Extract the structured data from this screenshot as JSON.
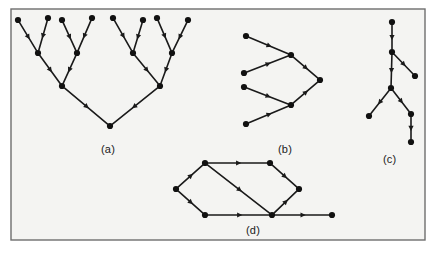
{
  "figure": {
    "background_color": "#f4f4f2",
    "page_color": "#ffffff",
    "border_color": "#6e6e6e",
    "node_color": "#111111",
    "edge_color": "#1a1a1a",
    "frame": {
      "x": 11,
      "y": 9,
      "width": 414,
      "height": 231
    },
    "node_radius": 3.1,
    "edge_width": 1.6
  },
  "panels": [
    {
      "id": "panel-a",
      "caption": "(a)",
      "caption_x": 110,
      "caption_y": 150,
      "description": "complete binary tree, eight leaves, edges directed from leaves toward root"
    },
    {
      "id": "panel-b",
      "caption": "(b)",
      "caption_x": 287,
      "caption_y": 150,
      "description": "two-level merge tree, four sources merging into one sink"
    },
    {
      "id": "panel-c",
      "caption": "(c)",
      "caption_x": 392,
      "caption_y": 160,
      "description": "vertical chain with two branchings"
    },
    {
      "id": "panel-d",
      "caption": "(d)",
      "caption_x": 255,
      "caption_y": 231,
      "description": "directed acyclic graph with a diamond and a trailing edge"
    }
  ],
  "graphs": {
    "a": {
      "nodes": [
        {
          "id": "a-l1",
          "x": 18,
          "y": 20
        },
        {
          "id": "a-l2",
          "x": 48,
          "y": 18
        },
        {
          "id": "a-l3",
          "x": 62,
          "y": 20
        },
        {
          "id": "a-l4",
          "x": 92,
          "y": 18
        },
        {
          "id": "a-l5",
          "x": 113,
          "y": 18
        },
        {
          "id": "a-l6",
          "x": 143,
          "y": 20
        },
        {
          "id": "a-l7",
          "x": 157,
          "y": 18
        },
        {
          "id": "a-l8",
          "x": 188,
          "y": 20
        },
        {
          "id": "a-m1",
          "x": 38,
          "y": 53
        },
        {
          "id": "a-m2",
          "x": 77,
          "y": 53
        },
        {
          "id": "a-m3",
          "x": 133,
          "y": 53
        },
        {
          "id": "a-m4",
          "x": 172,
          "y": 53
        },
        {
          "id": "a-n1",
          "x": 62,
          "y": 86
        },
        {
          "id": "a-n2",
          "x": 160,
          "y": 86
        },
        {
          "id": "a-root",
          "x": 110,
          "y": 126
        }
      ],
      "edges": [
        {
          "from": "a-l1",
          "to": "a-m1"
        },
        {
          "from": "a-l2",
          "to": "a-m1"
        },
        {
          "from": "a-l3",
          "to": "a-m2"
        },
        {
          "from": "a-l4",
          "to": "a-m2"
        },
        {
          "from": "a-l5",
          "to": "a-m3"
        },
        {
          "from": "a-l6",
          "to": "a-m3"
        },
        {
          "from": "a-l7",
          "to": "a-m4"
        },
        {
          "from": "a-l8",
          "to": "a-m4"
        },
        {
          "from": "a-m1",
          "to": "a-n1"
        },
        {
          "from": "a-m2",
          "to": "a-n1"
        },
        {
          "from": "a-m3",
          "to": "a-n2"
        },
        {
          "from": "a-m4",
          "to": "a-n2"
        },
        {
          "from": "a-n1",
          "to": "a-root"
        },
        {
          "from": "a-n2",
          "to": "a-root"
        }
      ]
    },
    "b": {
      "nodes": [
        {
          "id": "b-s1",
          "x": 246,
          "y": 36
        },
        {
          "id": "b-s2",
          "x": 244,
          "y": 73
        },
        {
          "id": "b-s3",
          "x": 244,
          "y": 87
        },
        {
          "id": "b-s4",
          "x": 246,
          "y": 124
        },
        {
          "id": "b-m1",
          "x": 291,
          "y": 55
        },
        {
          "id": "b-m2",
          "x": 291,
          "y": 105
        },
        {
          "id": "b-t",
          "x": 320,
          "y": 80
        }
      ],
      "edges": [
        {
          "from": "b-s1",
          "to": "b-m1"
        },
        {
          "from": "b-s2",
          "to": "b-m1"
        },
        {
          "from": "b-s3",
          "to": "b-m2"
        },
        {
          "from": "b-s4",
          "to": "b-m2"
        },
        {
          "from": "b-m1",
          "to": "b-t"
        },
        {
          "from": "b-m2",
          "to": "b-t"
        }
      ]
    },
    "c": {
      "nodes": [
        {
          "id": "c-top",
          "x": 392,
          "y": 22
        },
        {
          "id": "c-n2",
          "x": 392,
          "y": 52
        },
        {
          "id": "c-branch1",
          "x": 415,
          "y": 76
        },
        {
          "id": "c-n3",
          "x": 391,
          "y": 88
        },
        {
          "id": "c-left",
          "x": 369,
          "y": 116
        },
        {
          "id": "c-right",
          "x": 411,
          "y": 114
        },
        {
          "id": "c-bottom",
          "x": 411,
          "y": 142
        }
      ],
      "edges": [
        {
          "from": "c-top",
          "to": "c-n2"
        },
        {
          "from": "c-n2",
          "to": "c-branch1"
        },
        {
          "from": "c-n2",
          "to": "c-n3"
        },
        {
          "from": "c-n3",
          "to": "c-left"
        },
        {
          "from": "c-n3",
          "to": "c-right"
        },
        {
          "from": "c-right",
          "to": "c-bottom"
        }
      ]
    },
    "d": {
      "nodes": [
        {
          "id": "d-src",
          "x": 176,
          "y": 189
        },
        {
          "id": "d-top",
          "x": 205,
          "y": 163
        },
        {
          "id": "d-bot",
          "x": 205,
          "y": 215
        },
        {
          "id": "d-top2",
          "x": 270,
          "y": 163
        },
        {
          "id": "d-join",
          "x": 272,
          "y": 215
        },
        {
          "id": "d-right",
          "x": 299,
          "y": 189
        },
        {
          "id": "d-end",
          "x": 332,
          "y": 215
        }
      ],
      "edges": [
        {
          "from": "d-src",
          "to": "d-top"
        },
        {
          "from": "d-src",
          "to": "d-bot"
        },
        {
          "from": "d-top",
          "to": "d-top2"
        },
        {
          "from": "d-top",
          "to": "d-join"
        },
        {
          "from": "d-bot",
          "to": "d-join"
        },
        {
          "from": "d-top2",
          "to": "d-right"
        },
        {
          "from": "d-join",
          "to": "d-right"
        },
        {
          "from": "d-join",
          "to": "d-end"
        }
      ]
    }
  }
}
